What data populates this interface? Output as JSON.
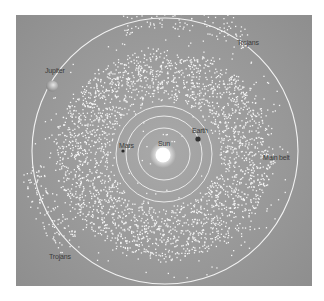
{
  "diagram": {
    "background_color": "#9c9c9c",
    "orbit_color": "#f2f2f2",
    "asteroid_color": "#f4f4f4",
    "labels": {
      "sun": "Sun",
      "mars": "Mars",
      "earth": "Earth",
      "jupiter": "Jupiter",
      "main_belt": "Main belt",
      "trojans_upper": "Trojans",
      "trojans_lower": "Trojans"
    },
    "bodies": [
      {
        "name": "Sun",
        "x": 147,
        "y": 140,
        "r": 8,
        "color": "#ffffff"
      },
      {
        "name": "Mars",
        "x": 107,
        "y": 136,
        "r": 1.6,
        "color": "#2a2a2a"
      },
      {
        "name": "Earth",
        "x": 182,
        "y": 124,
        "r": 2.6,
        "color": "#2a2a2a"
      },
      {
        "name": "Jupiter",
        "x": 35,
        "y": 70,
        "r": 6,
        "color": "#c9c9c9"
      }
    ],
    "orbits": [
      {
        "name": "Earth-inner",
        "cx": 148,
        "cy": 139,
        "r": 26
      },
      {
        "name": "Earth",
        "cx": 148,
        "cy": 139,
        "r": 38
      },
      {
        "name": "Mars",
        "cx": 148,
        "cy": 139,
        "r": 48
      },
      {
        "name": "Jupiter",
        "cx": 149,
        "cy": 136,
        "r": 133
      }
    ]
  }
}
